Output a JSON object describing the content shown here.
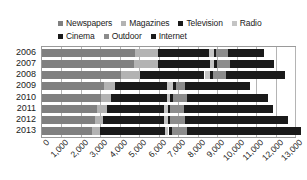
{
  "chart_data": {
    "type": "bar",
    "orientation": "horizontal",
    "stacked": true,
    "title": "",
    "xlabel": "",
    "ylabel": "",
    "xlim": [
      0,
      13000
    ],
    "grid": true,
    "legend_position": "top",
    "categories": [
      "2006",
      "2007",
      "2008",
      "2009",
      "2010",
      "2011",
      "2012",
      "2013"
    ],
    "x_tick_labels": [
      "0",
      "1,000",
      "2,000",
      "3,000",
      "4,000",
      "5,000",
      "6,000",
      "7,000",
      "8,000",
      "9,000",
      "10,000",
      "11,000",
      "12,000",
      "13,000"
    ],
    "x_tick_values": [
      0,
      1000,
      2000,
      3000,
      4000,
      5000,
      6000,
      7000,
      8000,
      9000,
      10000,
      11000,
      12000,
      13000
    ],
    "series": [
      {
        "name": "Newspapers",
        "color": "#808080",
        "values": [
          4800,
          4750,
          4050,
          3200,
          3050,
          2850,
          2700,
          2550
        ]
      },
      {
        "name": "Magazines",
        "color": "#b3b3b3",
        "values": [
          1150,
          1200,
          1000,
          550,
          500,
          500,
          450,
          450
        ]
      },
      {
        "name": "Television",
        "color": "#1a1a1a",
        "values": [
          2650,
          2700,
          3300,
          2650,
          2850,
          2900,
          3100,
          3300
        ]
      },
      {
        "name": "Radio",
        "color": "#c4c4c4",
        "values": [
          250,
          200,
          300,
          350,
          200,
          200,
          200,
          200
        ]
      },
      {
        "name": "Cinema",
        "color": "#1a1a1a",
        "values": [
          100,
          120,
          130,
          130,
          140,
          150,
          150,
          160
        ]
      },
      {
        "name": "Outdoor",
        "color": "#8c8c8c",
        "values": [
          600,
          700,
          700,
          450,
          700,
          700,
          750,
          800
        ]
      },
      {
        "name": "Internet",
        "color": "#1a1a1a",
        "values": [
          1850,
          2250,
          3000,
          3350,
          4150,
          4550,
          5300,
          5850
        ]
      }
    ]
  },
  "legend": {
    "rows": [
      [
        {
          "label": "Newspapers",
          "color": "#808080"
        },
        {
          "label": "Magazines",
          "color": "#b3b3b3"
        },
        {
          "label": "Television",
          "color": "#1a1a1a"
        },
        {
          "label": "Radio",
          "color": "#c4c4c4"
        }
      ],
      [
        {
          "label": "Cinema",
          "color": "#1a1a1a"
        },
        {
          "label": "Outdoor",
          "color": "#8c8c8c"
        },
        {
          "label": "Internet",
          "color": "#1a1a1a"
        }
      ]
    ]
  },
  "style": {
    "plot_border": "#9a9a9a",
    "gridline": "#b4b4b4",
    "background": "#ffffff",
    "text": "#1a1a1a"
  }
}
